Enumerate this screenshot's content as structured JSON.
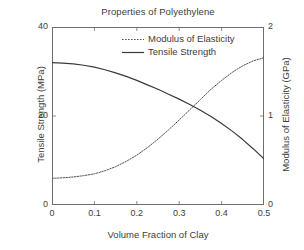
{
  "chart_data": {
    "type": "line",
    "title": "Properties of Polyethylene",
    "xlabel": "Volume Fraction of Clay",
    "ylabel": "Tensile Strength (MPa)",
    "ylabel_right": "Modulus of Elasticity (GPa)",
    "xlim": [
      0,
      0.5
    ],
    "ylim": [
      0,
      40
    ],
    "ylim_right": [
      0,
      2
    ],
    "grid": false,
    "legend_position": "top-right-inside",
    "xticks": [
      "0",
      "0.1",
      "0.2",
      "0.3",
      "0.4",
      "0.5"
    ],
    "xtick_values": [
      0,
      0.1,
      0.2,
      0.3,
      0.4,
      0.5
    ],
    "yticks_left": [
      "0",
      "20",
      "40"
    ],
    "ytick_left_values": [
      0,
      20,
      40
    ],
    "yticks_right": [
      "0",
      "1",
      "2"
    ],
    "ytick_right_values": [
      0,
      1,
      2
    ],
    "x": [
      0,
      0.025,
      0.05,
      0.075,
      0.1,
      0.125,
      0.15,
      0.175,
      0.2,
      0.225,
      0.25,
      0.275,
      0.3,
      0.325,
      0.35,
      0.375,
      0.4,
      0.425,
      0.45,
      0.475,
      0.5
    ],
    "series": [
      {
        "name": "Modulus of Elasticity",
        "axis": "right",
        "style": "dotted",
        "color": "#555555",
        "values": [
          0.3,
          0.305,
          0.315,
          0.33,
          0.35,
          0.385,
          0.43,
          0.49,
          0.56,
          0.645,
          0.74,
          0.845,
          0.955,
          1.07,
          1.185,
          1.3,
          1.4,
          1.49,
          1.565,
          1.62,
          1.655
        ]
      },
      {
        "name": "Tensile Strength",
        "axis": "left",
        "style": "solid",
        "color": "#3a3a3a",
        "values": [
          32.0,
          31.9,
          31.7,
          31.4,
          31.0,
          30.4,
          29.7,
          28.9,
          28.0,
          27.0,
          26.0,
          24.9,
          23.8,
          22.6,
          21.3,
          19.9,
          18.3,
          16.6,
          14.7,
          12.6,
          10.4
        ]
      }
    ],
    "annotations": []
  },
  "legend": {
    "items": [
      {
        "label": "Modulus of Elasticity",
        "style": "dotted"
      },
      {
        "label": "Tensile Strength",
        "style": "solid"
      }
    ]
  },
  "colors": {
    "background": "#ffffff",
    "axis": "#6e6e6e",
    "text": "#3d3d3d",
    "tensile_strength": "#3a3a3a",
    "modulus": "#555555"
  }
}
